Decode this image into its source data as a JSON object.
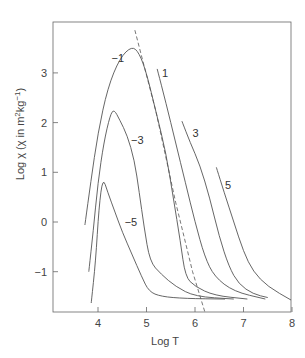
{
  "chart_data": {
    "type": "line",
    "title": "",
    "xlabel": "Log T",
    "ylabel": "Log χ (χ in m²kg⁻¹)",
    "ylabel_parts": {
      "prefix": "Log χ (χ in m",
      "sup1": "2",
      "mid": "kg",
      "sup2": "−1",
      "suffix": ")"
    },
    "xlim": [
      3.1,
      8.0
    ],
    "ylim": [
      -1.8,
      4.0
    ],
    "xticks": [
      4,
      5,
      6,
      7,
      8
    ],
    "yticks": [
      -1,
      0,
      1,
      2,
      3
    ],
    "ytick_labels": [
      "−1",
      "0",
      "1",
      "2",
      "3"
    ],
    "grid": false,
    "legend": "none (curves labeled inline)",
    "series": [
      {
        "name": "−5",
        "label_pos": [
          4.55,
          0.0
        ],
        "points": [
          [
            3.86,
            -1.63
          ],
          [
            3.95,
            -0.8
          ],
          [
            4.02,
            0.3
          ],
          [
            4.1,
            0.9
          ],
          [
            4.2,
            0.6
          ],
          [
            4.35,
            0.2
          ],
          [
            4.5,
            -0.2
          ],
          [
            4.7,
            -0.65
          ],
          [
            4.9,
            -1.1
          ],
          [
            5.05,
            -1.4
          ],
          [
            5.3,
            -1.5
          ],
          [
            5.8,
            -1.54
          ],
          [
            6.62,
            -1.55
          ]
        ]
      },
      {
        "name": "−3",
        "label_pos": [
          4.68,
          1.65
        ],
        "points": [
          [
            3.81,
            -1.0
          ],
          [
            3.9,
            -0.2
          ],
          [
            4.0,
            0.8
          ],
          [
            4.12,
            1.6
          ],
          [
            4.25,
            2.15
          ],
          [
            4.33,
            2.27
          ],
          [
            4.45,
            2.05
          ],
          [
            4.6,
            1.75
          ],
          [
            4.75,
            1.25
          ],
          [
            4.85,
            0.6
          ],
          [
            4.95,
            -0.1
          ],
          [
            5.07,
            -0.8
          ],
          [
            5.3,
            -1.05
          ],
          [
            5.6,
            -1.3
          ],
          [
            6.0,
            -1.5
          ],
          [
            6.8,
            -1.55
          ]
        ]
      },
      {
        "name": "−1",
        "label_pos": [
          4.28,
          3.3
        ],
        "points": [
          [
            3.73,
            -0.06
          ],
          [
            3.85,
            0.8
          ],
          [
            4.0,
            1.8
          ],
          [
            4.2,
            2.7
          ],
          [
            4.45,
            3.3
          ],
          [
            4.7,
            3.54
          ],
          [
            4.85,
            3.4
          ],
          [
            5.0,
            3.0
          ],
          [
            5.2,
            2.2
          ],
          [
            5.4,
            1.4
          ],
          [
            5.55,
            0.5
          ],
          [
            5.7,
            -0.4
          ],
          [
            5.8,
            -1.1
          ],
          [
            6.0,
            -1.3
          ],
          [
            6.4,
            -1.48
          ],
          [
            7.08,
            -1.55
          ]
        ]
      },
      {
        "name": "1",
        "label_pos": [
          5.32,
          3.0
        ],
        "points": [
          [
            5.22,
            3.08
          ],
          [
            5.4,
            2.4
          ],
          [
            5.6,
            1.6
          ],
          [
            5.8,
            0.8
          ],
          [
            6.0,
            0.0
          ],
          [
            6.2,
            -0.7
          ],
          [
            6.4,
            -1.1
          ],
          [
            6.8,
            -1.4
          ],
          [
            7.45,
            -1.55
          ]
        ]
      },
      {
        "name": "3",
        "label_pos": [
          5.95,
          1.8
        ],
        "points": [
          [
            5.73,
            2.03
          ],
          [
            5.9,
            1.6
          ],
          [
            6.1,
            1.15
          ],
          [
            6.3,
            0.5
          ],
          [
            6.5,
            -0.3
          ],
          [
            6.7,
            -0.9
          ],
          [
            6.9,
            -1.25
          ],
          [
            7.2,
            -1.45
          ],
          [
            7.5,
            -1.52
          ]
        ]
      },
      {
        "name": "5",
        "label_pos": [
          6.62,
          0.75
        ],
        "points": [
          [
            6.44,
            1.1
          ],
          [
            6.6,
            0.6
          ],
          [
            6.8,
            0.0
          ],
          [
            7.0,
            -0.6
          ],
          [
            7.2,
            -1.0
          ],
          [
            7.5,
            -1.3
          ],
          [
            7.98,
            -1.57
          ]
        ]
      }
    ],
    "dashed_line": {
      "points": [
        [
          4.76,
          3.86
        ],
        [
          5.2,
          2.2
        ],
        [
          5.6,
          0.4
        ],
        [
          5.95,
          -1.0
        ],
        [
          6.2,
          -1.8
        ]
      ]
    }
  }
}
